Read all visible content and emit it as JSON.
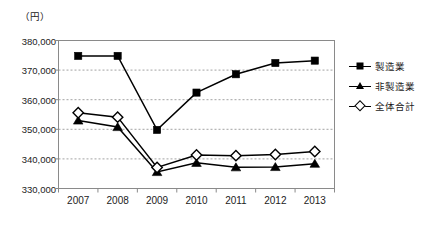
{
  "chart_data": {
    "type": "line",
    "title": "",
    "unit_label": "（円）",
    "xlabel": "",
    "ylabel": "",
    "categories": [
      "2007",
      "2008",
      "2009",
      "2010",
      "2011",
      "2012",
      "2013"
    ],
    "ylim": [
      330000,
      380000
    ],
    "ytick_values": [
      330000,
      340000,
      350000,
      360000,
      370000,
      380000
    ],
    "ytick_labels": [
      "330,000",
      "340,000",
      "350,000",
      "360,000",
      "370,000",
      "380,000"
    ],
    "grid": "horizontal-dashed",
    "legend_position": "right",
    "series": [
      {
        "name": "製造業",
        "marker": "filled-square",
        "color": "#000000",
        "values": [
          374800,
          374800,
          349800,
          362400,
          368600,
          372400,
          373200
        ]
      },
      {
        "name": "非製造業",
        "marker": "filled-triangle",
        "color": "#000000",
        "values": [
          353000,
          350800,
          335600,
          338700,
          337200,
          337300,
          338400
        ]
      },
      {
        "name": "全体合計",
        "marker": "open-diamond",
        "color": "#000000",
        "values": [
          355600,
          354100,
          337100,
          341300,
          341100,
          341500,
          342500
        ]
      }
    ]
  },
  "legend": {
    "items": [
      {
        "label": "製造業",
        "marker": "filled-square"
      },
      {
        "label": "非製造業",
        "marker": "filled-triangle"
      },
      {
        "label": "全体合計",
        "marker": "open-diamond"
      }
    ]
  },
  "axes": {
    "unit": "（円）"
  },
  "colors": {
    "ink": "#000000",
    "frame": "#8a8a8a",
    "grid": "#999999",
    "background": "#ffffff"
  }
}
